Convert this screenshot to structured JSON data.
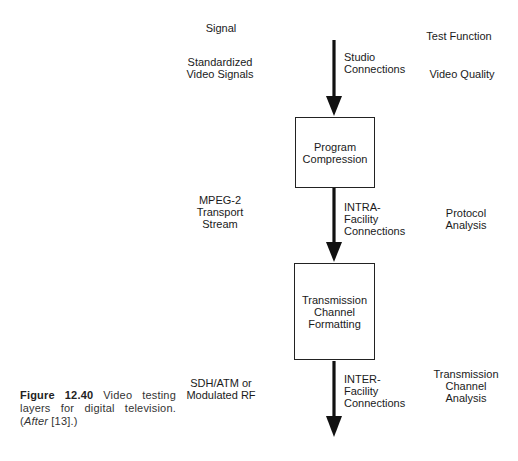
{
  "diagram": {
    "column_headers": {
      "signal": "Signal",
      "test_function": "Test Function"
    },
    "layers": [
      {
        "signal": [
          "Standardized",
          "Video Signals"
        ],
        "connection": [
          "Studio",
          "Connections"
        ],
        "test_function": [
          "Video Quality"
        ]
      },
      {
        "signal": [
          "MPEG-2",
          "Transport",
          "Stream"
        ],
        "connection": [
          "INTRA-",
          "Facility",
          "Connections"
        ],
        "test_function": [
          "Protocol",
          "Analysis"
        ]
      },
      {
        "signal": [
          "SDH/ATM or",
          "Modulated RF"
        ],
        "connection": [
          "INTER-",
          "Facility",
          "Connections"
        ],
        "test_function": [
          "Transmission",
          "Channel",
          "Analysis"
        ]
      }
    ],
    "blocks": [
      {
        "lines": [
          "Program",
          "Compression"
        ]
      },
      {
        "lines": [
          "Transmission",
          "Channel",
          "Formatting"
        ]
      }
    ],
    "arrow_color": "#111111"
  },
  "caption": {
    "figure_label": "Figure 12.40",
    "text": " Video testing layers for digital television. (",
    "after_label": "After",
    "reference": " [13].)"
  }
}
